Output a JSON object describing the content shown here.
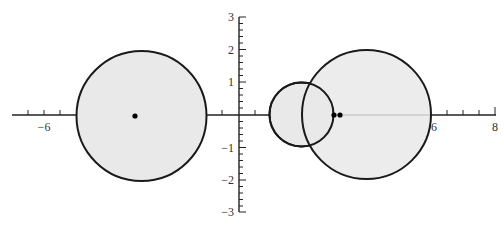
{
  "figure": {
    "type": "circles-on-cartesian-plane",
    "x_axis": {
      "range": [
        -7,
        8
      ],
      "labeled_ticks": [
        {
          "value": -6,
          "label": "−6"
        },
        {
          "value": 6,
          "label": "6"
        },
        {
          "value": 8,
          "label": "8"
        }
      ],
      "minor_tick_step": 0.5
    },
    "y_axis": {
      "range": [
        -3,
        3
      ],
      "labeled_ticks": [
        {
          "value": 3,
          "label": "3"
        },
        {
          "value": 2,
          "label": "2"
        },
        {
          "value": 1,
          "label": "1"
        },
        {
          "value": -1,
          "label": "−1"
        },
        {
          "value": -2,
          "label": "−2"
        },
        {
          "value": -3,
          "label": "−3"
        }
      ],
      "minor_tick_step": 0.2
    },
    "circles": [
      {
        "name": "left-circle",
        "center": [
          -3,
          0
        ],
        "radius": 2
      },
      {
        "name": "small-middle-circle",
        "center": [
          1.9,
          0
        ],
        "radius": 1
      },
      {
        "name": "large-right-circle",
        "center": [
          3.9,
          0
        ],
        "radius": 2
      }
    ],
    "points": [
      {
        "name": "left-point",
        "coords": [
          -3.2,
          0
        ]
      },
      {
        "name": "right-point-a",
        "coords": [
          2.9,
          0
        ]
      },
      {
        "name": "right-point-b",
        "coords": [
          3.1,
          0
        ]
      }
    ],
    "colors": {
      "circle_fill": "#e9e9e9",
      "stroke": "#1a1a1a",
      "axis": "#222222",
      "label": "#333333"
    }
  }
}
